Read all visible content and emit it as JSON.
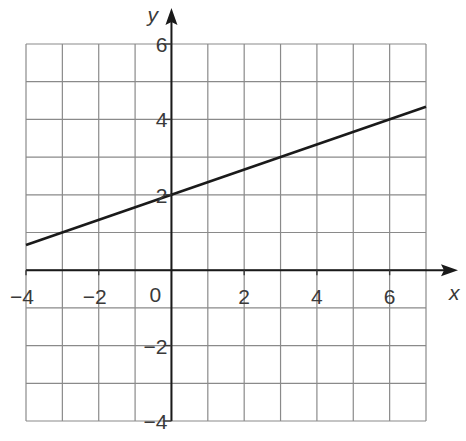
{
  "chart_data": {
    "type": "line",
    "title": "",
    "xlabel": "x",
    "ylabel": "y",
    "xlim": [
      -4,
      7
    ],
    "ylim": [
      -4,
      6
    ],
    "grid": true,
    "grid_step": 1,
    "x_ticks": [
      -4,
      -2,
      2,
      4,
      6
    ],
    "x_tick_labels": [
      "−4",
      "−2",
      "2",
      "4",
      "6"
    ],
    "y_ticks": [
      6,
      4,
      2,
      -2,
      -4
    ],
    "y_tick_labels": [
      "6",
      "4",
      "2",
      "−2",
      "−4"
    ],
    "origin_label": "0",
    "series": [
      {
        "name": "y = x/3 + 2",
        "slope": 0.3333,
        "intercept": 2,
        "x": [
          -4,
          7
        ],
        "y": [
          0.667,
          4.333
        ],
        "color": "#1a1a1a"
      }
    ],
    "colors": {
      "grid": "#8a8a8a",
      "axis": "#1a1a1a",
      "text": "#3a3a3a"
    }
  }
}
